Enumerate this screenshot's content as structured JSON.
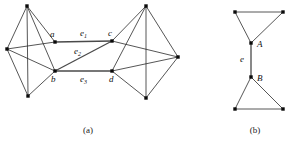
{
  "figure": {
    "panels": [
      {
        "id": "panel-a",
        "caption": "(a)",
        "caption_x": 88,
        "caption_y": 133,
        "vertices": [
          {
            "name": "left-top",
            "label": "",
            "x": 27,
            "y": 6
          },
          {
            "name": "left-west",
            "label": "",
            "x": 7,
            "y": 49
          },
          {
            "name": "left-bottom",
            "label": "",
            "x": 28,
            "y": 96
          },
          {
            "name": "a",
            "label": "a",
            "x": 55,
            "y": 42,
            "label_x": 50,
            "label_y": 37
          },
          {
            "name": "b",
            "label": "b",
            "x": 55,
            "y": 71,
            "label_x": 51,
            "label_y": 82
          },
          {
            "name": "c",
            "label": "c",
            "x": 112,
            "y": 41,
            "label_x": 108,
            "label_y": 36
          },
          {
            "name": "d",
            "label": "d",
            "x": 112,
            "y": 71,
            "label_x": 109,
            "label_y": 82
          },
          {
            "name": "right-top",
            "label": "",
            "x": 146,
            "y": 6
          },
          {
            "name": "right-east",
            "label": "",
            "x": 178,
            "y": 57
          },
          {
            "name": "right-bottom",
            "label": "",
            "x": 146,
            "y": 98
          }
        ],
        "edges": [
          {
            "name": "edge-lefttop-leftwest",
            "from": "left-top",
            "to": "left-west",
            "bridge": false
          },
          {
            "name": "edge-lefttop-leftbottom",
            "from": "left-top",
            "to": "left-bottom",
            "bridge": false
          },
          {
            "name": "edge-lefttop-a",
            "from": "left-top",
            "to": "a",
            "bridge": false
          },
          {
            "name": "edge-lefttop-b",
            "from": "left-top",
            "to": "b",
            "bridge": false
          },
          {
            "name": "edge-leftwest-leftbottom",
            "from": "left-west",
            "to": "left-bottom",
            "bridge": false
          },
          {
            "name": "edge-leftwest-a",
            "from": "left-west",
            "to": "a",
            "bridge": false
          },
          {
            "name": "edge-leftwest-b",
            "from": "left-west",
            "to": "b",
            "bridge": false
          },
          {
            "name": "edge-leftbottom-b",
            "from": "left-bottom",
            "to": "b",
            "bridge": false
          },
          {
            "name": "edge-righttop-righteast",
            "from": "right-top",
            "to": "right-east",
            "bridge": false
          },
          {
            "name": "edge-righttop-rightbottom",
            "from": "right-top",
            "to": "right-bottom",
            "bridge": false
          },
          {
            "name": "edge-righttop-c",
            "from": "right-top",
            "to": "c",
            "bridge": false
          },
          {
            "name": "edge-righttop-d",
            "from": "right-top",
            "to": "d",
            "bridge": false
          },
          {
            "name": "edge-righteast-rightbottom",
            "from": "right-east",
            "to": "right-bottom",
            "bridge": false
          },
          {
            "name": "edge-righteast-c",
            "from": "right-east",
            "to": "c",
            "bridge": false
          },
          {
            "name": "edge-righteast-d",
            "from": "right-east",
            "to": "d",
            "bridge": false
          },
          {
            "name": "edge-rightbottom-d",
            "from": "right-bottom",
            "to": "d",
            "bridge": false
          },
          {
            "name": "edge-e1-a-c",
            "from": "a",
            "to": "c",
            "bridge": true,
            "label": "e",
            "sub": "1",
            "label_x": 80,
            "label_y": 36
          },
          {
            "name": "edge-e2-b-c",
            "from": "b",
            "to": "c",
            "bridge": true,
            "label": "e",
            "sub": "2",
            "label_x": 74,
            "label_y": 54
          },
          {
            "name": "edge-e3-b-d",
            "from": "b",
            "to": "d",
            "bridge": true,
            "label": "e",
            "sub": "3",
            "label_x": 80,
            "label_y": 82
          }
        ]
      },
      {
        "id": "panel-b",
        "caption": "(b)",
        "caption_x": 255,
        "caption_y": 133,
        "vertices": [
          {
            "name": "top-left-corner",
            "label": "",
            "x": 235,
            "y": 12
          },
          {
            "name": "top-right-corner",
            "label": "",
            "x": 283,
            "y": 12
          },
          {
            "name": "A",
            "label": "A",
            "x": 251,
            "y": 43,
            "label_x": 257,
            "label_y": 47
          },
          {
            "name": "B",
            "label": "B",
            "x": 251,
            "y": 77,
            "label_x": 257,
            "label_y": 81
          },
          {
            "name": "bottom-left-corner",
            "label": "",
            "x": 235,
            "y": 109
          },
          {
            "name": "bottom-right-corner",
            "label": "",
            "x": 283,
            "y": 109
          }
        ],
        "edges": [
          {
            "name": "edge-topleft-topright",
            "from": "top-left-corner",
            "to": "top-right-corner",
            "bridge": false
          },
          {
            "name": "edge-topleft-A",
            "from": "top-left-corner",
            "to": "A",
            "bridge": false
          },
          {
            "name": "edge-topright-A",
            "from": "top-right-corner",
            "to": "A",
            "bridge": false
          },
          {
            "name": "edge-bottomleft-bottomright",
            "from": "bottom-left-corner",
            "to": "bottom-right-corner",
            "bridge": false
          },
          {
            "name": "edge-bottomleft-B",
            "from": "bottom-left-corner",
            "to": "B",
            "bridge": false
          },
          {
            "name": "edge-bottomright-B",
            "from": "bottom-right-corner",
            "to": "B",
            "bridge": false
          },
          {
            "name": "edge-e-A-B",
            "from": "A",
            "to": "B",
            "bridge": true,
            "label": "e",
            "sub": "",
            "label_x": 240,
            "label_y": 62
          }
        ]
      }
    ],
    "bottom_caption": {
      "text": "",
      "x": 144,
      "y": 148
    }
  }
}
